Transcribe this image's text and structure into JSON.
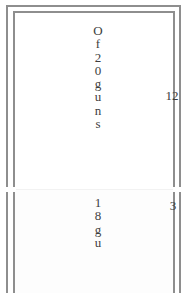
{
  "document": {
    "kind": "scanned-table-fragment",
    "frame_color": "#8e8e8e",
    "text_color": "#3d3d3d",
    "background": "#ffffff"
  },
  "table": {
    "rows": [
      {
        "name": "row-top",
        "label_text": "Of 20 guns",
        "label_chars": [
          "O",
          "f",
          "2",
          "0",
          "g",
          "u",
          "n",
          "s"
        ],
        "number": "12"
      },
      {
        "name": "row-bottom",
        "label_text": "18 gu",
        "label_chars": [
          "1",
          "8",
          "g",
          "u"
        ],
        "number": "3"
      }
    ]
  }
}
